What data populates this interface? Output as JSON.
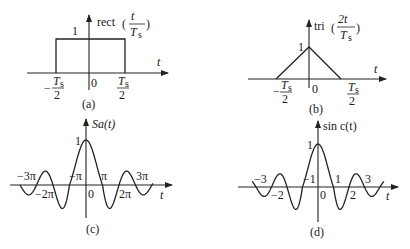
{
  "panels": {
    "a": {
      "caption": "(a)",
      "function_name": "rect",
      "argument_numerator": "t",
      "argument_denominator": "T",
      "argument_denominator_sub": "s",
      "amplitude_label": "1",
      "axis_label": "t",
      "origin_label": "0",
      "tick_left_num": "T",
      "tick_left_sub": "s",
      "tick_left_den": "2",
      "tick_left_sign": "−",
      "tick_right_num": "T",
      "tick_right_sub": "s",
      "tick_right_den": "2"
    },
    "b": {
      "caption": "(b)",
      "function_name": "tri",
      "argument_numerator": "2t",
      "argument_denominator": "T",
      "argument_denominator_sub": "s",
      "amplitude_label": "1",
      "axis_label": "t",
      "origin_label": "0",
      "tick_left_num": "T",
      "tick_left_sub": "s",
      "tick_left_den": "2",
      "tick_left_sign": "−",
      "tick_right_num": "T",
      "tick_right_sub": "s",
      "tick_right_den": "2"
    },
    "c": {
      "caption": "(c)",
      "function_label": "Sa(t)",
      "amplitude_label": "1",
      "axis_label": "t",
      "origin_label": "0",
      "ticks": [
        "−3π",
        "−2π",
        "−π",
        "π",
        "2π",
        "3π"
      ]
    },
    "d": {
      "caption": "(d)",
      "function_label": "sin c(t)",
      "amplitude_label": "1",
      "axis_label": "t",
      "origin_label": "0",
      "ticks": [
        "−3",
        "−2",
        "−1",
        "1",
        "2",
        "3"
      ]
    }
  },
  "colors": {
    "ink": "#1a1a1a",
    "background": "#ffffff"
  }
}
